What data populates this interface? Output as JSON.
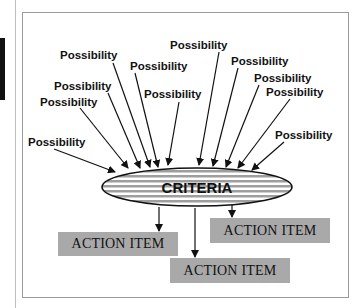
{
  "colors": {
    "action_fill": "#a9a9a9",
    "ellipse_stripe": "#9e9e9e",
    "frame_border": "#9a9a9a",
    "ink": "#111111"
  },
  "criteria": {
    "label": "CRITERIA"
  },
  "possibilities": [
    {
      "label": "Possibility"
    },
    {
      "label": "Possibility"
    },
    {
      "label": "Possibility"
    },
    {
      "label": "Possibility"
    },
    {
      "label": "Possibility"
    },
    {
      "label": "Possibility"
    },
    {
      "label": "Possibility"
    },
    {
      "label": "Possibility"
    },
    {
      "label": "Possibility"
    },
    {
      "label": "Possibility"
    },
    {
      "label": "Possibility"
    },
    {
      "label": "Possibility"
    }
  ],
  "action_items": [
    {
      "label": "ACTION ITEM"
    },
    {
      "label": "ACTION ITEM"
    },
    {
      "label": "ACTION ITEM"
    }
  ]
}
